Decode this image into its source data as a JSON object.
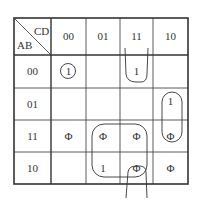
{
  "kmap": {
    "row_var": "AB",
    "col_var": "CD",
    "col_headers": [
      "00",
      "01",
      "11",
      "10"
    ],
    "row_headers": [
      "00",
      "01",
      "11",
      "10"
    ],
    "cells": [
      [
        "1",
        "",
        "1",
        ""
      ],
      [
        "",
        "",
        "",
        "1"
      ],
      [
        "Φ",
        "Φ",
        "Φ",
        "Φ"
      ],
      [
        "",
        "1",
        "Φ",
        "Φ"
      ]
    ],
    "groups": [
      {
        "name": "m0-single",
        "cells": [
          "00-00"
        ]
      },
      {
        "name": "col11-wrap",
        "cells": [
          "00-11",
          "10-11"
        ]
      },
      {
        "name": "col10-pair",
        "cells": [
          "01-10",
          "11-10"
        ]
      },
      {
        "name": "quad-center",
        "cells": [
          "11-01",
          "11-11",
          "10-01",
          "10-11"
        ]
      }
    ]
  }
}
